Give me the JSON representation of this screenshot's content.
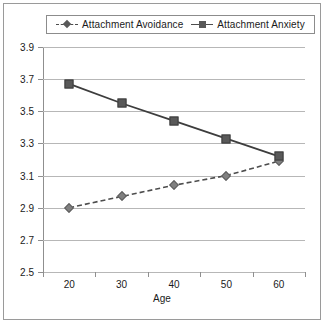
{
  "chart_data": {
    "type": "line",
    "title": "",
    "xlabel": "Age",
    "ylabel": "",
    "categories": [
      20,
      30,
      40,
      50,
      60
    ],
    "x_tick_labels": [
      "20",
      "30",
      "40",
      "50",
      "60"
    ],
    "y_tick_labels": [
      "2.5",
      "2.7",
      "2.9",
      "3.1",
      "3.3",
      "3.5",
      "3.7",
      "3.9"
    ],
    "y_ticks": [
      2.5,
      2.7,
      2.9,
      3.1,
      3.3,
      3.5,
      3.7,
      3.9
    ],
    "ylim": [
      2.5,
      3.9
    ],
    "grid": "horizontal",
    "legend_position": "top",
    "series": [
      {
        "name": "Attachment Avoidance",
        "values": [
          2.9,
          2.97,
          3.04,
          3.1,
          3.19
        ],
        "line_style": "dashed",
        "marker": "diamond",
        "color": "#808080"
      },
      {
        "name": "Attachment Anxiety",
        "values": [
          3.67,
          3.55,
          3.44,
          3.33,
          3.22
        ],
        "line_style": "solid",
        "marker": "square",
        "color": "#595959"
      }
    ]
  },
  "legend": {
    "entries": [
      {
        "label": "Attachment Avoidance"
      },
      {
        "label": "Attachment Anxiety"
      }
    ]
  },
  "axis": {
    "x_title": "Age"
  },
  "colors": {
    "gridline": "#b7b7b7",
    "axis": "#8f8f8f",
    "frame": "#9a9a9a",
    "text": "#1a1a1a",
    "series_anxiety": "#4d4d4d",
    "series_avoidance": "#808080"
  }
}
